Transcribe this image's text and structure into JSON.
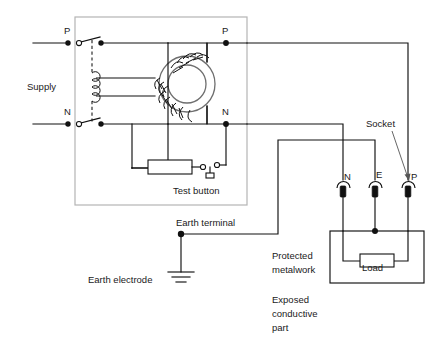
{
  "diagram": {
    "labels": {
      "supply": "Supply",
      "supply_p": "P",
      "supply_n": "N",
      "out_p": "P",
      "out_n": "N",
      "test_button": "Test button",
      "earth_terminal": "Earth terminal",
      "earth_electrode": "Earth electrode",
      "socket": "Socket",
      "socket_n": "N",
      "socket_e": "E",
      "socket_p": "P",
      "load": "Load",
      "protected_metalwork_line1": "Protected",
      "protected_metalwork_line2": "metalwork",
      "exposed_line1": "Exposed",
      "exposed_line2": "conductive",
      "exposed_line3": "part"
    },
    "colors": {
      "wire": "#111111",
      "enclosure": "#b4b4b4",
      "core": "#6e6e6e",
      "background": "#ffffff",
      "text": "#1a1a1a"
    },
    "components": [
      {
        "name": "double-pole-switch-p",
        "type": "switch",
        "label": "P"
      },
      {
        "name": "double-pole-switch-n",
        "type": "switch",
        "label": "N"
      },
      {
        "name": "toroidal-current-transformer",
        "type": "transformer"
      },
      {
        "name": "trip-coil",
        "type": "coil"
      },
      {
        "name": "test-resistor",
        "type": "resistor"
      },
      {
        "name": "test-button",
        "type": "pushbutton",
        "label": "Test button"
      },
      {
        "name": "socket-outlet",
        "type": "socket",
        "label": "Socket"
      },
      {
        "name": "load-resistor",
        "type": "resistor",
        "label": "Load"
      },
      {
        "name": "earth-electrode",
        "type": "ground",
        "label": "Earth electrode"
      }
    ]
  }
}
